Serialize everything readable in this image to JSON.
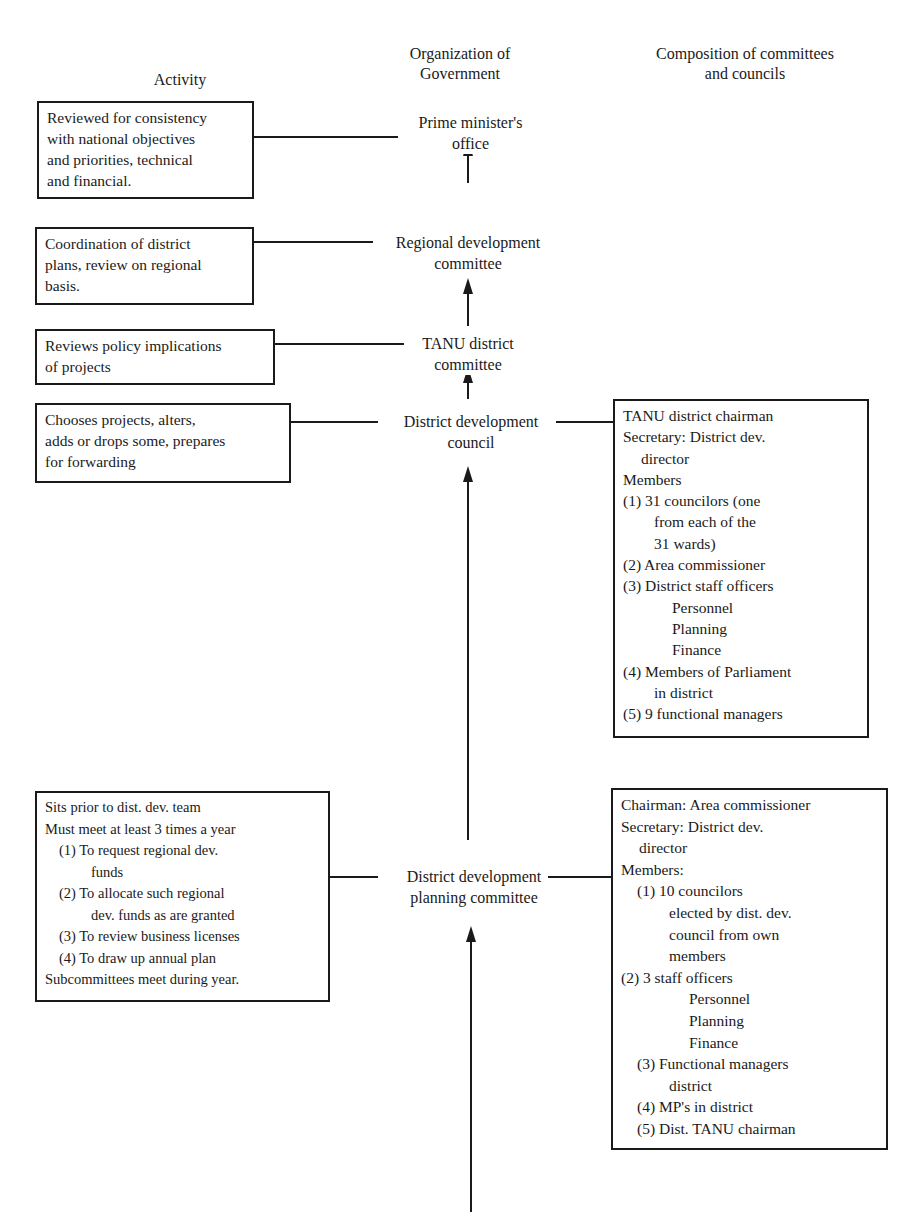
{
  "headers": {
    "activity": "Activity",
    "organization": [
      "Organization of",
      "Government"
    ],
    "composition": [
      "Composition of committees",
      "and councils"
    ]
  },
  "organization_nodes": [
    {
      "id": "prime-minister",
      "lines": [
        "Prime minister's",
        "office"
      ]
    },
    {
      "id": "regional-dev-committee",
      "lines": [
        "Regional development",
        "committee"
      ]
    },
    {
      "id": "tanu-district-committee",
      "lines": [
        "TANU district",
        "committee"
      ]
    },
    {
      "id": "district-dev-council",
      "lines": [
        "District development",
        "council"
      ]
    },
    {
      "id": "district-dev-planning-committee",
      "lines": [
        "District development",
        "planning committee"
      ]
    }
  ],
  "activities": [
    {
      "lines": [
        "Reviewed for consistency",
        "with national objectives",
        "and priorities, technical",
        "and financial."
      ]
    },
    {
      "lines": [
        "Coordination of district",
        "plans, review on regional",
        "basis."
      ]
    },
    {
      "lines": [
        "Reviews policy implications",
        "of projects"
      ]
    },
    {
      "lines": [
        "Chooses projects, alters,",
        "adds or drops some, prepares",
        "for forwarding"
      ]
    },
    {
      "lines": [
        "Sits prior to dist. dev. team",
        "Must meet at least 3 times a year",
        "(1) To request regional dev.",
        "funds",
        "(2) To allocate such regional",
        "dev. funds as are granted",
        "(3) To review business licenses",
        "(4) To draw up annual plan",
        "Subcommittees meet during year."
      ]
    }
  ],
  "compositions": [
    {
      "node": "district-dev-council",
      "lines": [
        "TANU district chairman",
        "Secretary: District dev.",
        "director",
        "Members",
        "(1) 31 councilors (one",
        "from each of the",
        "31 wards)",
        "(2) Area commissioner",
        "(3) District staff officers",
        "Personnel",
        "Planning",
        "Finance",
        "(4) Members of Parliament",
        "in district",
        "(5) 9 functional managers"
      ]
    },
    {
      "node": "district-dev-planning-committee",
      "lines": [
        "Chairman: Area commissioner",
        "Secretary: District dev.",
        "director",
        "Members:",
        "(1) 10 councilors",
        "elected by dist. dev.",
        "council from own",
        "members",
        "(2) 3 staff officers",
        "Personnel",
        "Planning",
        "Finance",
        "(3) Functional managers",
        "district",
        "(4) MP's in district",
        "(5) Dist. TANU chairman"
      ]
    }
  ],
  "colors": {
    "ink": "#1a1a1a",
    "paper": "#ffffff"
  }
}
